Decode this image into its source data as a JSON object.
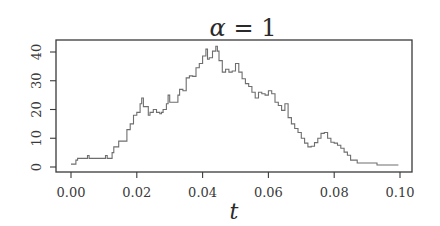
{
  "chart_data": {
    "type": "line",
    "title": "α = 1",
    "title_parts": {
      "symbol": "α",
      "rest": " = 1"
    },
    "xlabel": "t",
    "ylabel": "",
    "xlim": [
      0.0,
      0.1
    ],
    "ylim": [
      0,
      43
    ],
    "xticks": [
      0.0,
      0.02,
      0.04,
      0.06,
      0.08,
      0.1
    ],
    "xtick_labels": [
      "0.00",
      "0.02",
      "0.04",
      "0.06",
      "0.08",
      "0.10"
    ],
    "yticks": [
      0,
      10,
      20,
      30,
      40
    ],
    "ytick_labels": [
      "0",
      "10",
      "20",
      "30",
      "40"
    ],
    "grid": false,
    "legend": null,
    "line_color": "#6e6e6e",
    "step": true,
    "series": [
      {
        "name": "alpha=1 path",
        "x": [
          0.0,
          0.001,
          0.0015,
          0.002,
          0.0045,
          0.005,
          0.0055,
          0.01,
          0.0105,
          0.011,
          0.012,
          0.0125,
          0.013,
          0.0145,
          0.0165,
          0.017,
          0.018,
          0.019,
          0.02,
          0.021,
          0.0215,
          0.022,
          0.0235,
          0.024,
          0.025,
          0.026,
          0.027,
          0.0275,
          0.028,
          0.029,
          0.0295,
          0.03,
          0.0305,
          0.0315,
          0.0325,
          0.033,
          0.034,
          0.035,
          0.036,
          0.037,
          0.038,
          0.039,
          0.04,
          0.041,
          0.0415,
          0.042,
          0.043,
          0.044,
          0.0445,
          0.045,
          0.046,
          0.047,
          0.048,
          0.049,
          0.05,
          0.051,
          0.052,
          0.053,
          0.054,
          0.055,
          0.056,
          0.057,
          0.058,
          0.059,
          0.06,
          0.061,
          0.062,
          0.063,
          0.064,
          0.065,
          0.066,
          0.067,
          0.068,
          0.069,
          0.07,
          0.071,
          0.072,
          0.073,
          0.074,
          0.075,
          0.076,
          0.077,
          0.078,
          0.079,
          0.08,
          0.081,
          0.082,
          0.083,
          0.084,
          0.085,
          0.086,
          0.087,
          0.088,
          0.09,
          0.092,
          0.093,
          0.099,
          0.0995
        ],
        "y": [
          1,
          1,
          2.4,
          3,
          3,
          4,
          3,
          3,
          4,
          3,
          3,
          5,
          7,
          9,
          9,
          13,
          15,
          18,
          19,
          22,
          24,
          21,
          18,
          19,
          20,
          19,
          18.5,
          19,
          20,
          22,
          25,
          22.5,
          22.5,
          22.5,
          25,
          27,
          26.5,
          31,
          31.7,
          31.5,
          34.5,
          36,
          38.6,
          41,
          37.5,
          38,
          40.3,
          42,
          40.3,
          37,
          33,
          34,
          33,
          33.4,
          36,
          33,
          30.7,
          29,
          28,
          26,
          24,
          26,
          25.5,
          25,
          26.5,
          25.5,
          22.5,
          21.4,
          19.7,
          22,
          17.2,
          15,
          13.4,
          12,
          10,
          8.3,
          7,
          7.2,
          8.5,
          10,
          11.7,
          12,
          10,
          8.6,
          8.3,
          7.6,
          6.5,
          5.2,
          4.1,
          2.4,
          2.4,
          1.4,
          1.4,
          1.4,
          1.4,
          0.7,
          0.7,
          0.7
        ]
      }
    ],
    "layout": {
      "plot_box": {
        "left": 56,
        "top": 40,
        "right": 412,
        "bottom": 172
      },
      "x_pixel": {
        "at_0.00": 71,
        "at_0.10": 400
      },
      "y_pixel": {
        "at_0": 167,
        "at_40": 52
      }
    }
  }
}
